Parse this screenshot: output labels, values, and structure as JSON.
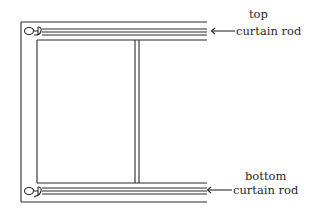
{
  "diagram": {
    "type": "window-curtain-rod-illustration",
    "stroke_color": "#2a2a2a",
    "background": "#ffffff"
  },
  "labels": {
    "top_rod": {
      "line1": "top",
      "line2": "curtain rod"
    },
    "bottom_rod": {
      "line1": "bottom",
      "line2": "curtain rod"
    }
  },
  "elements": {
    "window_frame": "window-frame",
    "center_mullion": "window-mullion",
    "top_rod": "top-curtain-rod",
    "bottom_rod": "bottom-curtain-rod",
    "top_finial": "finial-icon",
    "bottom_finial": "finial-icon",
    "top_arrow": "arrow-left-icon",
    "bottom_arrow": "arrow-left-icon"
  }
}
